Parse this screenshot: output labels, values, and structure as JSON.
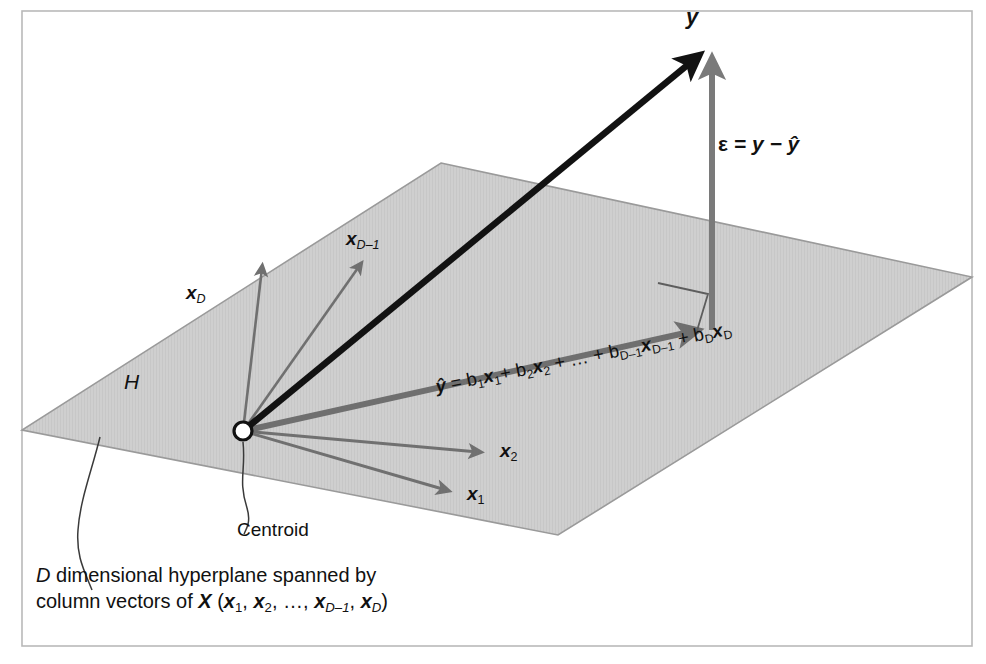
{
  "figure": {
    "domain": "diagram",
    "title_text": "",
    "background_color": "#ffffff",
    "frame_color": "#b9b9b9",
    "plane_fill": "#cfcfcf",
    "plane_stroke": "#9a9a9a",
    "vector_black": "#121212",
    "vector_gray": "#6f6f6f",
    "axis_gray": "#707070",
    "text_color": "#111111"
  },
  "labels": {
    "y": "y",
    "epsilon_symbol": "ε",
    "epsilon_equation_rest": " = y − ŷ",
    "epsilon_equation_full": "ε = y − ŷ",
    "x_D": "x",
    "x_D_sub": "D",
    "x_Dm1": "x",
    "x_Dm1_sub": "D–1",
    "x_2": "x",
    "x_2_sub": "2",
    "x_1": "x",
    "x_1_sub": "1",
    "hyperplane": "H",
    "centroid": "Centroid"
  },
  "equation": {
    "lhs": "ŷ",
    "eq": " = ",
    "terms": [
      {
        "coef": "b",
        "coef_sub": "1",
        "vec": "x",
        "vec_sub": "1"
      },
      {
        "coef": "b",
        "coef_sub": "2",
        "vec": "x",
        "vec_sub": "2"
      },
      {
        "coef": "b",
        "coef_sub": "D–1",
        "vec": "x",
        "vec_sub": "D–1"
      },
      {
        "coef": "b",
        "coef_sub": "D",
        "vec": "x",
        "vec_sub": "D"
      }
    ],
    "plus": "+",
    "ellipsis": "…",
    "full_text": "ŷ = b1x1+ b2x2 + … + bD–1xD–1 + bDxD"
  },
  "caption": {
    "line1_lead": "D",
    "line1_rest": " dimensional hyperplane spanned by",
    "line2_lead": "column vectors of ",
    "line2_X": "X",
    "line2_open": " (",
    "line2_items": [
      "x1",
      "x2",
      "…",
      "xD–1",
      "xD"
    ],
    "line2_close": ")",
    "full_text": "D dimensional hyperplane spanned by column vectors of X (x1, x2, …, xD–1, xD)"
  },
  "geometry": {
    "origin": {
      "x": 243,
      "y": 431
    },
    "plane_corners": [
      {
        "x": 441,
        "y": 163
      },
      {
        "x": 972,
        "y": 277
      },
      {
        "x": 558,
        "y": 535
      },
      {
        "x": 22,
        "y": 430
      }
    ],
    "vectors": [
      {
        "name": "y",
        "to": {
          "x": 700,
          "y": 52
        },
        "color": "#121212",
        "width": 6.5
      },
      {
        "name": "y-hat",
        "to": {
          "x": 712,
          "y": 330
        },
        "color": "#6f6f6f",
        "width": 6.0
      },
      {
        "name": "epsilon",
        "from": {
          "x": 712,
          "y": 330
        },
        "to": {
          "x": 712,
          "y": 55
        },
        "color": "#7a7a7a",
        "width": 6.0
      },
      {
        "name": "x-D",
        "to": {
          "x": 262,
          "y": 262
        },
        "color": "#707070",
        "width": 2.6
      },
      {
        "name": "x-D-minus-1",
        "to": {
          "x": 361,
          "y": 259
        },
        "color": "#707070",
        "width": 2.6
      },
      {
        "name": "x-2",
        "to": {
          "x": 486,
          "y": 455
        },
        "color": "#707070",
        "width": 2.8
      },
      {
        "name": "x-1",
        "to": {
          "x": 455,
          "y": 494
        },
        "color": "#707070",
        "width": 2.8
      }
    ],
    "right_angle_marker": {
      "x": 658,
      "y": 283,
      "size": 50
    }
  }
}
